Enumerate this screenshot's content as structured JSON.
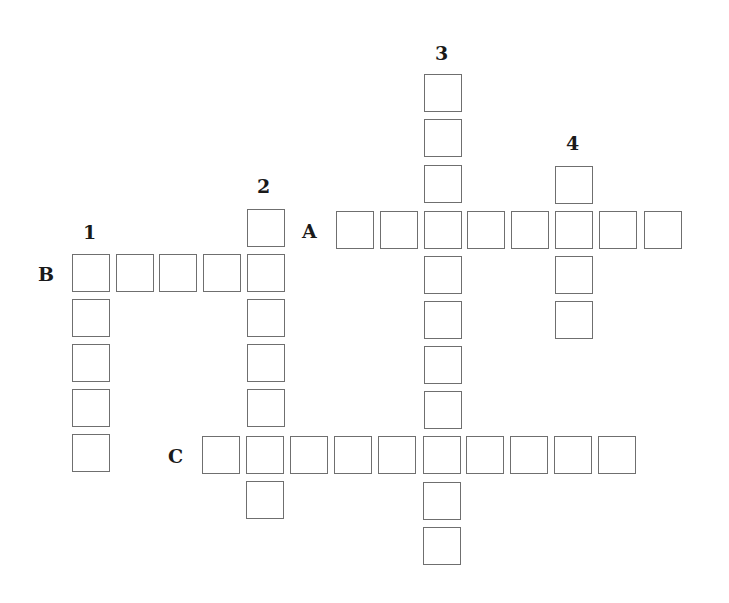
{
  "puzzle": {
    "type": "crossword",
    "cell_size": 38,
    "labels": {
      "down": [
        {
          "id": "1",
          "text": "1",
          "x": 83,
          "y": 223
        },
        {
          "id": "2",
          "text": "2",
          "x": 257,
          "y": 177
        },
        {
          "id": "3",
          "text": "3",
          "x": 435,
          "y": 44
        },
        {
          "id": "4",
          "text": "4",
          "x": 566,
          "y": 134
        }
      ],
      "across": [
        {
          "id": "A",
          "text": "A",
          "x": 302,
          "y": 222
        },
        {
          "id": "B",
          "text": "B",
          "x": 38,
          "y": 265
        },
        {
          "id": "C",
          "text": "C",
          "x": 168,
          "y": 447
        }
      ]
    },
    "words": {
      "A": {
        "direction": "across",
        "length": 8,
        "cells": [
          [
            336,
            211
          ],
          [
            380,
            211
          ],
          [
            424,
            211
          ],
          [
            467,
            211
          ],
          [
            511,
            211
          ],
          [
            555,
            211
          ],
          [
            599,
            211
          ],
          [
            644,
            211
          ]
        ]
      },
      "B": {
        "direction": "across",
        "length": 5,
        "cells": [
          [
            72,
            254
          ],
          [
            116,
            254
          ],
          [
            159,
            254
          ],
          [
            203,
            254
          ],
          [
            247,
            254
          ]
        ]
      },
      "C": {
        "direction": "across",
        "length": 10,
        "cells": [
          [
            202,
            436
          ],
          [
            246,
            436
          ],
          [
            290,
            436
          ],
          [
            334,
            436
          ],
          [
            378,
            436
          ],
          [
            423,
            436
          ],
          [
            466,
            436
          ],
          [
            510,
            436
          ],
          [
            554,
            436
          ],
          [
            598,
            436
          ]
        ]
      },
      "1": {
        "direction": "down",
        "length": 5,
        "cells": [
          [
            72,
            254
          ],
          [
            72,
            299
          ],
          [
            72,
            344
          ],
          [
            72,
            389
          ],
          [
            72,
            434
          ]
        ]
      },
      "2": {
        "direction": "down",
        "length": 7,
        "cells": [
          [
            247,
            209
          ],
          [
            247,
            254
          ],
          [
            247,
            299
          ],
          [
            247,
            344
          ],
          [
            247,
            389
          ],
          [
            246,
            436
          ],
          [
            246,
            481
          ]
        ]
      },
      "3": {
        "direction": "down",
        "length": 11,
        "cells": [
          [
            424,
            74
          ],
          [
            424,
            119
          ],
          [
            424,
            165
          ],
          [
            424,
            211
          ],
          [
            424,
            256
          ],
          [
            424,
            301
          ],
          [
            424,
            346
          ],
          [
            424,
            391
          ],
          [
            423,
            436
          ],
          [
            423,
            482
          ],
          [
            423,
            527
          ]
        ]
      },
      "4": {
        "direction": "down",
        "length": 4,
        "cells": [
          [
            555,
            166
          ],
          [
            555,
            211
          ],
          [
            555,
            256
          ],
          [
            555,
            301
          ]
        ]
      }
    },
    "border_color": "#6f6f6f",
    "label_color": "#1a1a1a"
  }
}
